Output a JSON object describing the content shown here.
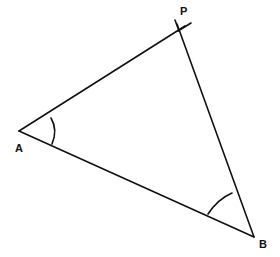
{
  "diagram": {
    "type": "triangle-construction",
    "stroke_color": "#111111",
    "background": "#ffffff",
    "vertices": [
      {
        "id": "A",
        "label": "A",
        "x": 19,
        "y": 131,
        "label_x": 15,
        "label_y": 152
      },
      {
        "id": "P",
        "label": "P",
        "x": 179,
        "y": 30,
        "label_x": 180,
        "label_y": 15
      },
      {
        "id": "B",
        "label": "B",
        "x": 254,
        "y": 237,
        "label_x": 259,
        "label_y": 248
      }
    ],
    "edges": [
      {
        "from": "A",
        "to": "P"
      },
      {
        "from": "P",
        "to": "B"
      },
      {
        "from": "A",
        "to": "B"
      }
    ],
    "construction_marks": [
      {
        "at": "P",
        "description": "crossing construction lines extending beyond P"
      }
    ],
    "angle_marks": [
      {
        "at": "A",
        "type": "single-arc"
      },
      {
        "at": "B",
        "type": "single-arc"
      }
    ]
  }
}
